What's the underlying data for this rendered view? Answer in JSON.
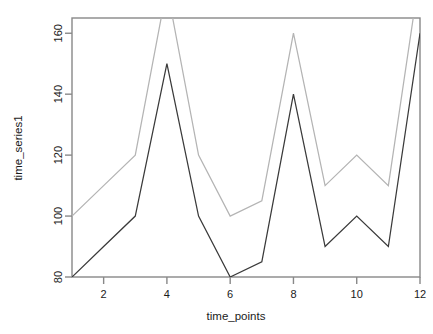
{
  "chart_data": {
    "type": "line",
    "title": "",
    "subtitle": "",
    "xlabel": "time_points",
    "ylabel": "time_series1",
    "x": [
      1,
      2,
      3,
      4,
      5,
      6,
      7,
      8,
      9,
      10,
      11,
      12
    ],
    "xlim": [
      1,
      12
    ],
    "ylim": [
      80,
      165
    ],
    "xticks": [
      2,
      4,
      6,
      8,
      10,
      12
    ],
    "xtick_labels": [
      "2",
      "4",
      "6",
      "8",
      "10",
      "12"
    ],
    "yticks": [
      80,
      100,
      120,
      140,
      160
    ],
    "ytick_labels": [
      "80",
      "100",
      "120",
      "140",
      "160"
    ],
    "grid": false,
    "legend": "none",
    "clipped_note": "series-2 exceeds the top of the plot region at x=4 and x=12",
    "series": [
      {
        "name": "series-1",
        "color": "#3a3a3a",
        "values": [
          80,
          90,
          100,
          150,
          100,
          80,
          85,
          140,
          90,
          100,
          90,
          160
        ]
      },
      {
        "name": "series-2",
        "color": "#b4b4b4",
        "values": [
          100,
          110,
          120,
          175,
          120,
          100,
          105,
          160,
          110,
          120,
          110,
          180
        ]
      }
    ]
  },
  "axes": {
    "x_axis_label": "time_points",
    "y_axis_label": "time_series1"
  }
}
